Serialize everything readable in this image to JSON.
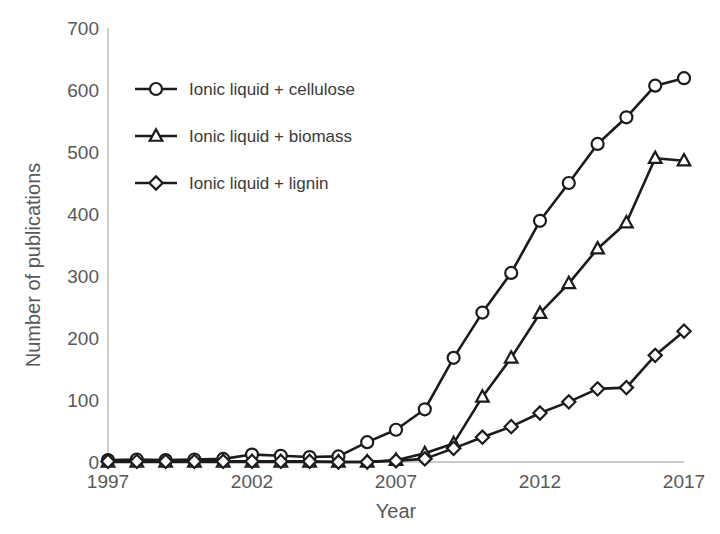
{
  "chart_data": {
    "type": "line",
    "title": "",
    "xlabel": "Year",
    "ylabel": "Number of publications",
    "xlim": [
      1997,
      2017
    ],
    "ylim": [
      0,
      700
    ],
    "xticks": [
      1997,
      2002,
      2007,
      2012,
      2017
    ],
    "yticks": [
      0,
      100,
      200,
      300,
      400,
      500,
      600,
      700
    ],
    "grid": false,
    "legend_position": "upper-left-inside",
    "x": [
      1997,
      1998,
      1999,
      2000,
      2001,
      2002,
      2003,
      2004,
      2005,
      2006,
      2007,
      2008,
      2009,
      2010,
      2011,
      2012,
      2013,
      2014,
      2015,
      2016,
      2017
    ],
    "series": [
      {
        "name": "Ionic liquid + cellulose",
        "marker": "circle",
        "values": [
          3,
          4,
          3,
          4,
          5,
          12,
          10,
          8,
          9,
          32,
          52,
          85,
          168,
          241,
          305,
          389,
          450,
          513,
          556,
          607,
          619
        ]
      },
      {
        "name": "Ionic liquid + biomass",
        "marker": "triangle",
        "values": [
          0,
          0,
          0,
          0,
          0,
          0,
          0,
          0,
          0,
          0,
          3,
          14,
          30,
          105,
          168,
          240,
          288,
          344,
          386,
          490,
          486
        ]
      },
      {
        "name": "Ionic liquid + lignin",
        "marker": "diamond",
        "values": [
          1,
          1,
          1,
          1,
          1,
          1,
          1,
          1,
          0,
          0,
          2,
          5,
          22,
          40,
          57,
          79,
          97,
          118,
          120,
          172,
          211
        ]
      }
    ]
  },
  "axes": {
    "ylabel": "Number of publications",
    "xlabel": "Year",
    "ytick_labels": [
      "700",
      "600",
      "500",
      "400",
      "300",
      "200",
      "100",
      "0"
    ],
    "xtick_labels": [
      "1997",
      "2002",
      "2007",
      "2012",
      "2017"
    ]
  },
  "legend": {
    "entries": [
      {
        "label": "Ionic liquid + cellulose",
        "marker": "circle"
      },
      {
        "label": "Ionic liquid + biomass",
        "marker": "triangle"
      },
      {
        "label": "Ionic liquid + lignin",
        "marker": "diamond"
      }
    ]
  },
  "colors": {
    "line": "#1b1b1b",
    "marker_fill": "#ffffff",
    "axis": "#b9b9b9",
    "text": "#58585a",
    "background": "#ffffff"
  }
}
